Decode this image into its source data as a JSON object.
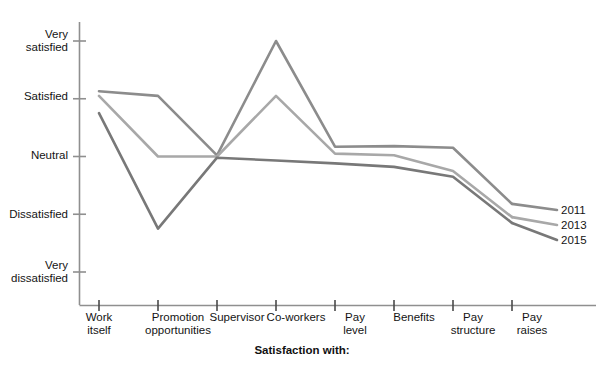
{
  "chart_data": {
    "type": "line",
    "title": "",
    "xlabel": "Satisfaction with:",
    "ylabel": "",
    "categories": [
      "Work\nitself",
      "Promotion\nopportunities",
      "Supervisor",
      "Co-workers",
      "Pay\nlevel",
      "Benefits",
      "Pay\nstructure",
      "Pay\nraises"
    ],
    "categories_flat": [
      "Work itself",
      "Promotion opportunities",
      "Supervisor",
      "Co-workers",
      "Pay level",
      "Benefits",
      "Pay structure",
      "Pay raises"
    ],
    "ytick_labels": [
      "Very\nsatisfied",
      "Satisfied",
      "Neutral",
      "Dissatisfied",
      "Very\ndissatisfied"
    ],
    "ytick_values": [
      5,
      4,
      3,
      2,
      1
    ],
    "ylim": [
      1,
      5
    ],
    "grid": false,
    "legend_position": "right-inline",
    "series": [
      {
        "name": "2011",
        "color": "#8c8c8c",
        "values": [
          4.13,
          4.05,
          3.02,
          5.0,
          3.17,
          3.18,
          3.15,
          2.18
        ]
      },
      {
        "name": "2013",
        "color": "#a8a8a8",
        "values": [
          4.05,
          3.0,
          3.0,
          4.05,
          3.05,
          3.02,
          2.75,
          1.95
        ]
      },
      {
        "name": "2015",
        "color": "#787878",
        "values": [
          3.75,
          1.75,
          2.98,
          2.93,
          2.88,
          2.82,
          2.65,
          1.85
        ]
      }
    ]
  },
  "axis": {
    "x_title": "Satisfaction with:"
  },
  "legend": {
    "entries": [
      "2011",
      "2013",
      "2015"
    ]
  }
}
